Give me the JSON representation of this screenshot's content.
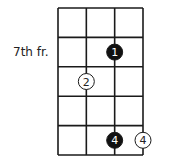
{
  "diagram": {
    "type": "chord-diagram",
    "strings": 4,
    "frets_shown": 5,
    "position_label": "7th fr.",
    "position_label_fret_row": 1,
    "colors": {
      "line": "#1a1a1a",
      "filled": "#111111",
      "open": "#ffffff"
    },
    "markers": [
      {
        "string": 3,
        "fret": 2,
        "label": "1",
        "style": "filled"
      },
      {
        "string": 2,
        "fret": 3,
        "label": "2",
        "style": "open",
        "on_line": true
      },
      {
        "string": 3,
        "fret": 5,
        "label": "4",
        "style": "filled"
      },
      {
        "string": 4,
        "fret": 5,
        "label": "4",
        "style": "open"
      }
    ]
  }
}
